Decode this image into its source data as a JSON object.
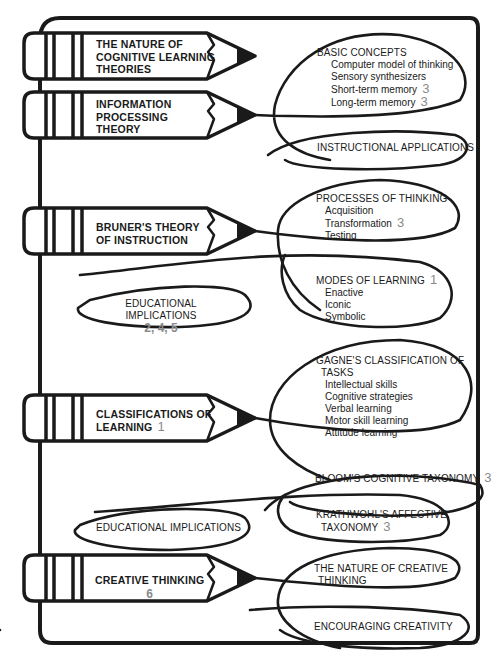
{
  "colors": {
    "ink": "#1a1a1a",
    "chapter_number": "#8a8a8a",
    "background": "#ffffff"
  },
  "pencils": [
    {
      "id": "nature",
      "lines": [
        "THE NATURE OF",
        "COGNITIVE LEARNING",
        "THEORIES"
      ],
      "number": ""
    },
    {
      "id": "info",
      "lines": [
        "INFORMATION",
        "PROCESSING",
        "THEORY"
      ],
      "number": ""
    },
    {
      "id": "bruner",
      "lines": [
        "BRUNER'S THEORY",
        "OF INSTRUCTION"
      ],
      "number": ""
    },
    {
      "id": "classif",
      "lines": [
        "CLASSIFICATIONS OF",
        "LEARNING"
      ],
      "number": "1"
    },
    {
      "id": "creative",
      "lines": [
        "CREATIVE THINKING"
      ],
      "number": "6"
    }
  ],
  "ovals": {
    "basic_concepts": {
      "heading": "BASIC CONCEPTS",
      "items": [
        {
          "label": "Computer model of thinking",
          "number": ""
        },
        {
          "label": "Sensory synthesizers",
          "number": ""
        },
        {
          "label": "Short-term memory",
          "number": "3"
        },
        {
          "label": "Long-term memory",
          "number": "3"
        }
      ]
    },
    "instructional_applications": {
      "heading": "INSTRUCTIONAL APPLICATIONS"
    },
    "processes_of_thinking": {
      "heading": "PROCESSES OF THINKING",
      "items": [
        {
          "label": "Acquisition",
          "number": ""
        },
        {
          "label": "Transformation",
          "number": "3"
        },
        {
          "label": "Testing",
          "number": ""
        }
      ]
    },
    "modes_of_learning": {
      "heading": "MODES OF LEARNING",
      "heading_number": "1",
      "items": [
        {
          "label": "Enactive"
        },
        {
          "label": "Iconic"
        },
        {
          "label": "Symbolic"
        }
      ]
    },
    "educational_implications_1": {
      "heading": "EDUCATIONAL IMPLICATIONS",
      "numbers": "2, 4, 5"
    },
    "gagne": {
      "heading_line1": "GAGNE'S CLASSIFICATION OF",
      "heading_line2": "TASKS",
      "items": [
        {
          "label": "Intellectual skills"
        },
        {
          "label": "Cognitive strategies"
        },
        {
          "label": "Verbal learning"
        },
        {
          "label": "Motor skill learning"
        },
        {
          "label": "Attitude learning"
        }
      ]
    },
    "bloom": {
      "heading": "BLOOM'S COGNITIVE TAXONOMY",
      "number": "3"
    },
    "krathwohl": {
      "heading_line1": "KRATHWOHL'S AFFECTIVE",
      "heading_line2": "TAXONOMY",
      "number": "3"
    },
    "educational_implications_2": {
      "heading": "EDUCATIONAL IMPLICATIONS"
    },
    "nature_creative": {
      "heading_line1": "THE NATURE OF CREATIVE",
      "heading_line2": "THINKING"
    },
    "encouraging_creativity": {
      "heading": "ENCOURAGING CREATIVITY"
    }
  }
}
